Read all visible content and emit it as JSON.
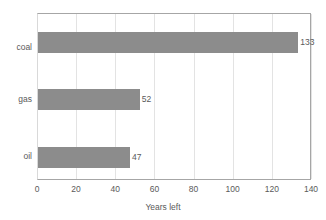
{
  "chart_data": {
    "type": "bar",
    "orientation": "horizontal",
    "title": "",
    "categories": [
      "coal",
      "gas",
      "oil"
    ],
    "values": [
      133,
      52,
      47
    ],
    "data_labels": [
      "133",
      "52",
      "47"
    ],
    "xlabel": "Years left",
    "ylabel": "",
    "xlim": [
      0,
      140
    ],
    "xticks": [
      0,
      20,
      40,
      60,
      80,
      100,
      120,
      140
    ],
    "xtick_labels": [
      "0",
      "20",
      "40",
      "60",
      "80",
      "100",
      "120",
      "140"
    ],
    "grid": "vertical",
    "legend": "none",
    "series": [
      {
        "name": "Years left",
        "values": [
          133,
          52,
          47
        ],
        "color": "#8c8c8c"
      }
    ],
    "colors": {
      "bar": "#8c8c8c",
      "gridline": "#e3e3e3",
      "axis": "#a6a6a6",
      "text": "#5a5a5a",
      "background": "#ffffff"
    }
  }
}
